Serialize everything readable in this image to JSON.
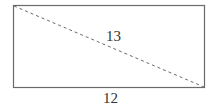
{
  "diagram": {
    "shape": "rectangle",
    "rect": {
      "x": 13,
      "y": 5,
      "width": 192,
      "height": 83
    },
    "diagonal": {
      "from": "top-left",
      "to": "bottom-right",
      "style": "dashed"
    },
    "labels": {
      "diagonal": "13",
      "bottom_side": "12"
    },
    "colors": {
      "stroke": "#6a6a6a",
      "text": "#333333"
    }
  }
}
